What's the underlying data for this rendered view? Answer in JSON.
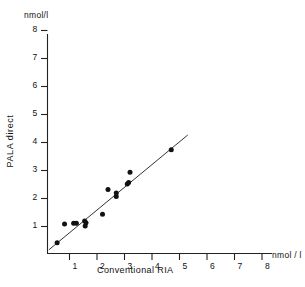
{
  "axes": {
    "y_unit": "nmol/l",
    "x_unit": "nmol / l",
    "x_title": "Conventional  RIA",
    "y_title": "PALA   direct"
  },
  "chart_data": {
    "type": "scatter",
    "title": "",
    "xlabel": "Conventional RIA",
    "ylabel": "PALA direct",
    "x_unit": "nmol/l",
    "y_unit": "nmol/l",
    "xlim": [
      0,
      8.5
    ],
    "ylim": [
      0,
      8.6
    ],
    "xticks": [
      1,
      2,
      3,
      4,
      5,
      6,
      7,
      8
    ],
    "yticks": [
      1,
      2,
      3,
      4,
      5,
      6,
      7,
      8
    ],
    "grid": false,
    "legend": "none",
    "marker": "filled-circle",
    "marker_color": "#111111",
    "points": [
      {
        "x": 0.35,
        "y": 0.4
      },
      {
        "x": 0.62,
        "y": 1.07
      },
      {
        "x": 0.95,
        "y": 1.1
      },
      {
        "x": 1.05,
        "y": 1.1
      },
      {
        "x": 1.35,
        "y": 1.18
      },
      {
        "x": 1.37,
        "y": 1.0
      },
      {
        "x": 1.4,
        "y": 1.12
      },
      {
        "x": 2.0,
        "y": 1.42
      },
      {
        "x": 2.2,
        "y": 2.3
      },
      {
        "x": 2.5,
        "y": 2.05
      },
      {
        "x": 2.5,
        "y": 2.18
      },
      {
        "x": 2.9,
        "y": 2.5
      },
      {
        "x": 2.95,
        "y": 2.55
      },
      {
        "x": 3.0,
        "y": 2.92
      },
      {
        "x": 4.5,
        "y": 3.72
      }
    ],
    "fit_line": {
      "x_start": 0.05,
      "y_start": 0.15,
      "x_end": 5.1,
      "y_end": 4.25,
      "color": "#333333"
    }
  },
  "ticks": {
    "y": [
      "8",
      "7",
      "6",
      "5",
      "4",
      "3",
      "2",
      "1"
    ],
    "x": [
      "1",
      "2",
      "3",
      "4",
      "5",
      "6",
      "7",
      "8"
    ]
  }
}
